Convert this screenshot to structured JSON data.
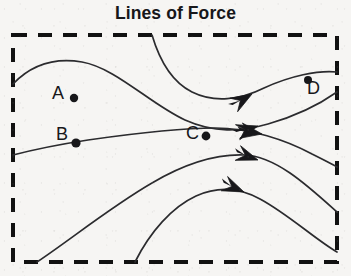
{
  "figure": {
    "title": "Lines of Force",
    "caption_position": "top-center",
    "background_color": "#f6f5f3",
    "ink_color": "#17171a",
    "border": {
      "style": "dashed",
      "shape": "rectangle",
      "color": "#111111",
      "thickness_px": 4,
      "x": 13,
      "y": 35,
      "width": 324,
      "height": 227
    },
    "points": [
      {
        "id": "A",
        "label": "A",
        "label_x": 58,
        "label_y": 97,
        "dot_x": 74,
        "dot_y": 98,
        "dot_r": 4.2,
        "on_line": false,
        "dot_side": "right"
      },
      {
        "id": "B",
        "label": "B",
        "label_x": 62,
        "label_y": 138,
        "dot_x": 76,
        "dot_y": 143,
        "dot_r": 4.6,
        "on_line": true,
        "dot_side": "right"
      },
      {
        "id": "C",
        "label": "C",
        "label_x": 192,
        "label_y": 137,
        "dot_x": 206,
        "dot_y": 136,
        "dot_r": 4.4,
        "on_line": false,
        "dot_side": "right"
      },
      {
        "id": "D",
        "label": "D",
        "label_x": 313,
        "label_y": 92,
        "dot_x": 308,
        "dot_y": 80,
        "dot_r": 4.0,
        "on_line": false,
        "dot_side": "upper-left"
      }
    ],
    "field_lines": [
      {
        "id": "line-1",
        "name": "upper-left-crest-line",
        "enters": "left-edge",
        "exits": "right-edge-upper",
        "path": "M 13 84 C 34 62, 58 58, 82 62 C 116 68, 150 104, 185 120 C 214 133, 240 132, 268 124 C 296 116, 320 104, 337 92",
        "arrow_at_x": 258,
        "arrow_at_y": 126,
        "arrow_angle_deg": -18
      },
      {
        "id": "line-2",
        "name": "top-edge-descending-line",
        "enters": "top-edge",
        "exits": "right-edge-top",
        "path": "M 152 35 C 160 62, 172 82, 192 92 C 214 103, 240 100, 264 88 C 290 76, 318 70, 337 72",
        "arrow_at_x": 252,
        "arrow_at_y": 94,
        "arrow_angle_deg": -32
      },
      {
        "id": "line-3",
        "name": "central-horizontal-line-through-B",
        "enters": "left-edge",
        "exits": "right-edge-middle",
        "path": "M 13 155 C 40 148, 62 144, 88 140 C 130 134, 175 128, 215 128 C 250 128, 286 140, 312 154 C 324 160, 332 164, 337 167",
        "arrow_at_x": 262,
        "arrow_at_y": 134,
        "arrow_angle_deg": 8
      },
      {
        "id": "line-4",
        "name": "lower-rising-line",
        "enters": "bottom-edge",
        "exits": "right-edge-lower",
        "path": "M 37 262 C 70 240, 112 206, 152 183 C 186 163, 216 154, 244 155 C 276 156, 308 186, 337 212",
        "arrow_at_x": 258,
        "arrow_at_y": 160,
        "arrow_angle_deg": 18
      },
      {
        "id": "line-5",
        "name": "bottom-rising-line",
        "enters": "bottom-edge",
        "exits": "right-edge-bottom",
        "path": "M 135 262 C 150 232, 172 207, 196 196 C 218 186, 240 188, 260 199 C 288 214, 316 240, 337 252",
        "arrow_at_x": 244,
        "arrow_at_y": 192,
        "arrow_angle_deg": 22
      }
    ],
    "arrow_count": 5,
    "arrow_style": "barbed-swept-back",
    "arrow_direction": "rightward"
  }
}
